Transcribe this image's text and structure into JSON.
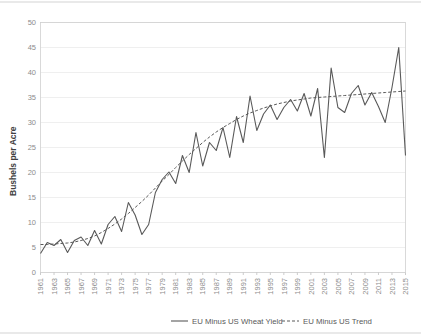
{
  "chart_data": {
    "type": "line",
    "title": "",
    "xlabel": "",
    "ylabel": "Bushels per Acre",
    "ylim": [
      0,
      50
    ],
    "ytick_values": [
      0,
      5,
      10,
      15,
      20,
      25,
      30,
      35,
      40,
      45,
      50
    ],
    "ytick_labels": [
      "0",
      "5",
      "10",
      "15",
      "20",
      "25",
      "30",
      "35",
      "40",
      "45",
      "50"
    ],
    "xlim": [
      1961,
      2015
    ],
    "x": [
      1961,
      1962,
      1963,
      1964,
      1965,
      1966,
      1967,
      1968,
      1969,
      1970,
      1971,
      1972,
      1973,
      1974,
      1975,
      1976,
      1977,
      1978,
      1979,
      1980,
      1981,
      1982,
      1983,
      1984,
      1985,
      1986,
      1987,
      1988,
      1989,
      1990,
      1991,
      1992,
      1993,
      1994,
      1995,
      1996,
      1997,
      1998,
      1999,
      2000,
      2001,
      2002,
      2003,
      2004,
      2005,
      2006,
      2007,
      2008,
      2009,
      2010,
      2011,
      2012,
      2013,
      2014,
      2015
    ],
    "xtick_labels": [
      "1961",
      "1963",
      "1965",
      "1967",
      "1969",
      "1971",
      "1973",
      "1975",
      "1977",
      "1979",
      "1981",
      "1983",
      "1985",
      "1987",
      "1989",
      "1991",
      "1993",
      "1995",
      "1997",
      "1999",
      "2001",
      "2003",
      "2005",
      "2007",
      "2009",
      "2011",
      "2013",
      "2015"
    ],
    "grid": "horizontal",
    "legend_position": "bottom",
    "series": [
      {
        "name": "EU Minus US Wheat Yield",
        "style": "solid",
        "color": "#595959",
        "values": [
          3.8,
          6.0,
          5.4,
          6.6,
          4.0,
          6.4,
          7.1,
          5.4,
          8.4,
          5.7,
          9.6,
          11.2,
          8.2,
          14.0,
          11.5,
          7.6,
          9.6,
          16.0,
          18.6,
          20.1,
          17.8,
          23.4,
          20.0,
          28.0,
          21.3,
          26.0,
          24.4,
          29.0,
          23.0,
          31.2,
          26.0,
          35.3,
          28.4,
          31.7,
          33.5,
          30.6,
          33.0,
          34.6,
          32.3,
          35.8,
          31.3,
          36.8,
          23.0,
          40.9,
          33.0,
          32.0,
          35.8,
          37.4,
          33.5,
          36.0,
          33.2,
          30.0,
          37.0,
          45.0,
          23.4
        ]
      },
      {
        "name": "EU Minus US Trend",
        "style": "dashed",
        "color": "#595959",
        "values": [
          5.6,
          5.6,
          5.7,
          5.8,
          5.9,
          6.1,
          6.4,
          6.8,
          7.3,
          8.0,
          8.8,
          9.7,
          10.7,
          11.8,
          13.0,
          14.2,
          15.5,
          16.9,
          18.3,
          19.6,
          21.0,
          22.3,
          23.6,
          24.8,
          26.0,
          27.1,
          28.1,
          29.0,
          29.8,
          30.6,
          31.3,
          31.9,
          32.4,
          32.9,
          33.3,
          33.7,
          34.0,
          34.3,
          34.5,
          34.7,
          34.9,
          35.0,
          35.1,
          35.2,
          35.3,
          35.4,
          35.5,
          35.6,
          35.7,
          35.8,
          35.9,
          36.0,
          36.1,
          36.2,
          36.3
        ]
      }
    ]
  },
  "legend": {
    "items": [
      {
        "label": "EU Minus US Wheat Yield",
        "style": "solid"
      },
      {
        "label": "EU Minus US Trend",
        "style": "dashed"
      }
    ]
  }
}
